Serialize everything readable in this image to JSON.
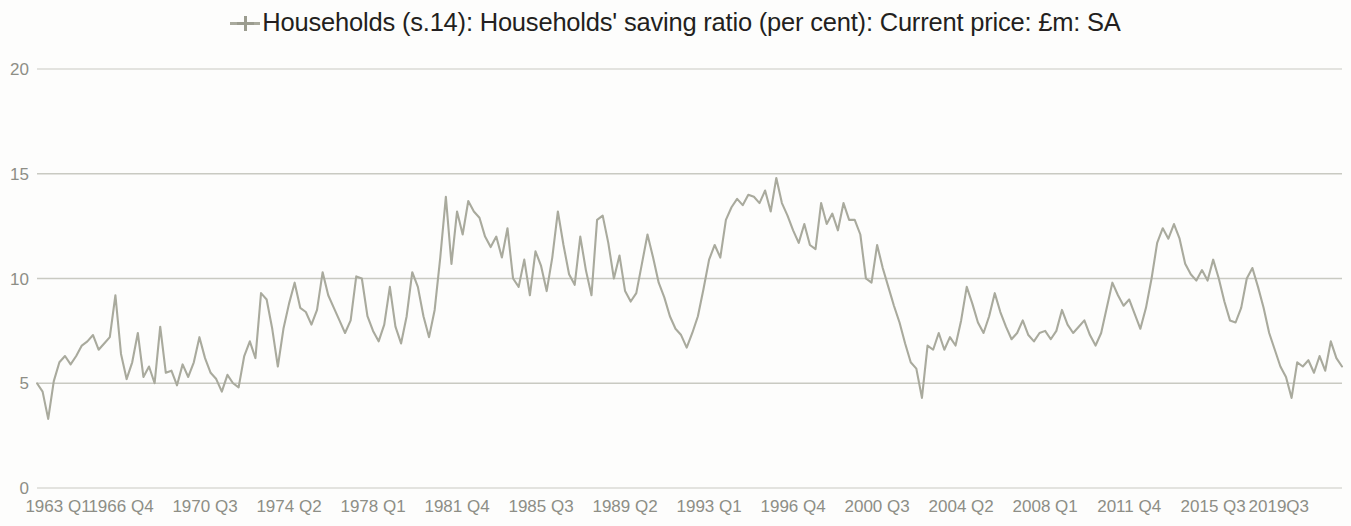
{
  "legend": {
    "label": "Households (s.14): Households' saving ratio (per cent): Current price: £m: SA",
    "marker_icon": "line-cross-marker-icon",
    "color": "#a9aa9d"
  },
  "colors": {
    "series": "#a9aa9d",
    "gridline": "#c9cac2",
    "axis_text": "#8d8e86",
    "title_text": "#231f20",
    "background": "#fdfdfc"
  },
  "chart_data": {
    "type": "line",
    "title": "Households (s.14): Households' saving ratio (per cent): Current price: £m: SA",
    "xlabel": "",
    "ylabel": "",
    "ylim": [
      0,
      20
    ],
    "yticks": [
      0,
      5,
      10,
      15,
      20
    ],
    "ytick_labels": [
      "0",
      "5",
      "10",
      "15",
      "20"
    ],
    "grid": true,
    "legend_position": "top-center",
    "xtick_labels": [
      "1963 Q1",
      "1966 Q4",
      "1970 Q3",
      "1974 Q2",
      "1978 Q1",
      "1981 Q4",
      "1985 Q3",
      "1989 Q2",
      "1993 Q1",
      "1996 Q4",
      "2000 Q3",
      "2004 Q2",
      "2008 Q1",
      "2011 Q4",
      "2015 Q3",
      "2019Q3"
    ],
    "xtick_indices": [
      0,
      15,
      30,
      45,
      60,
      75,
      90,
      105,
      120,
      135,
      150,
      165,
      180,
      195,
      210,
      226
    ],
    "x_start": "1963 Q1",
    "x_end": "2019 Q3",
    "series": [
      {
        "name": "Households (s.14): Households' saving ratio (per cent): Current price: £m: SA",
        "values": [
          5.0,
          4.6,
          3.3,
          5.1,
          6.0,
          6.3,
          5.9,
          6.3,
          6.8,
          7.0,
          7.3,
          6.6,
          6.9,
          7.2,
          9.2,
          6.4,
          5.2,
          6.0,
          7.4,
          5.3,
          5.8,
          5.0,
          7.7,
          5.5,
          5.6,
          4.9,
          5.9,
          5.3,
          6.0,
          7.2,
          6.2,
          5.5,
          5.2,
          4.6,
          5.4,
          5.0,
          4.8,
          6.3,
          7.0,
          6.2,
          9.3,
          9.0,
          7.6,
          5.8,
          7.6,
          8.8,
          9.8,
          8.6,
          8.4,
          7.8,
          8.5,
          10.3,
          9.2,
          8.6,
          8.0,
          7.4,
          8.0,
          10.1,
          10.0,
          8.2,
          7.5,
          7.0,
          7.8,
          9.6,
          7.7,
          6.9,
          8.2,
          10.3,
          9.6,
          8.2,
          7.2,
          8.5,
          11.0,
          13.9,
          10.7,
          13.2,
          12.1,
          13.7,
          13.2,
          12.9,
          12.0,
          11.5,
          12.0,
          11.0,
          12.4,
          10.0,
          9.6,
          10.9,
          9.2,
          11.3,
          10.6,
          9.4,
          11.0,
          13.2,
          11.6,
          10.2,
          9.7,
          12.0,
          10.4,
          9.2,
          12.8,
          13.0,
          11.7,
          10.0,
          11.1,
          9.4,
          8.9,
          9.3,
          10.7,
          12.1,
          11.0,
          9.8,
          9.1,
          8.2,
          7.6,
          7.3,
          6.7,
          7.4,
          8.2,
          9.5,
          10.9,
          11.6,
          11.0,
          12.8,
          13.4,
          13.8,
          13.5,
          14.0,
          13.9,
          13.6,
          14.2,
          13.2,
          14.8,
          13.6,
          13.0,
          12.3,
          11.7,
          12.6,
          11.6,
          11.4,
          13.6,
          12.6,
          13.1,
          12.3,
          13.6,
          12.8,
          12.8,
          12.1,
          10.0,
          9.8,
          11.6,
          10.5,
          9.6,
          8.7,
          7.9,
          6.9,
          6.0,
          5.7,
          4.3,
          6.8,
          6.6,
          7.4,
          6.6,
          7.2,
          6.8,
          8.0,
          9.6,
          8.8,
          7.9,
          7.4,
          8.2,
          9.3,
          8.4,
          7.7,
          7.1,
          7.4,
          8.0,
          7.3,
          7.0,
          7.4,
          7.5,
          7.1,
          7.5,
          8.5,
          7.8,
          7.4,
          7.7,
          8.0,
          7.3,
          6.8,
          7.4,
          8.6,
          9.8,
          9.2,
          8.7,
          9.0,
          8.3,
          7.6,
          8.6,
          10.0,
          11.7,
          12.4,
          11.9,
          12.6,
          11.9,
          10.7,
          10.2,
          9.9,
          10.4,
          9.9,
          10.9,
          10.0,
          8.9,
          8.0,
          7.9,
          8.6,
          10.0,
          10.5,
          9.6,
          8.6,
          7.4,
          6.6,
          5.8,
          5.3,
          4.3,
          6.0,
          5.8,
          6.1,
          5.5,
          6.3,
          5.6,
          7.0,
          6.2,
          5.8
        ]
      }
    ]
  }
}
